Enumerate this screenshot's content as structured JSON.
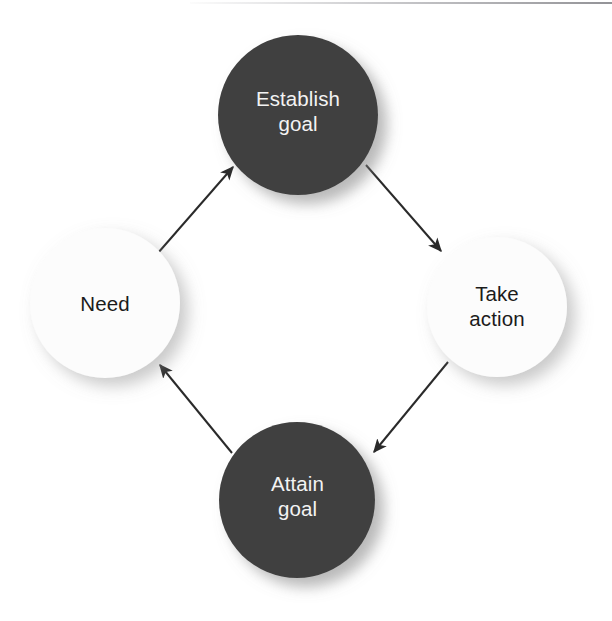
{
  "diagram": {
    "type": "cycle-diagram",
    "background_color": "#ffffff",
    "dark_node_color": "#414141",
    "light_node_color": "#fcfcfc",
    "dark_node_text_color": "#f3f3f3",
    "light_node_text_color": "#1b1b1b",
    "arrow_color": "#2a2a2a",
    "nodes": [
      {
        "id": "establish-goal",
        "label": "Establish\ngoal",
        "style": "dark",
        "position": "top",
        "cx": 298,
        "cy": 115,
        "r": 80
      },
      {
        "id": "take-action",
        "label": "Take\naction",
        "style": "light",
        "position": "right",
        "cx": 497,
        "cy": 307,
        "r": 70
      },
      {
        "id": "attain-goal",
        "label": "Attain\ngoal",
        "style": "dark",
        "position": "bottom",
        "cx": 297,
        "cy": 500,
        "r": 78
      },
      {
        "id": "need",
        "label": "Need",
        "style": "light",
        "position": "left",
        "cx": 105,
        "cy": 303,
        "r": 75
      }
    ],
    "edges": [
      {
        "id": "need-to-establish-goal",
        "from": "need",
        "to": "establish-goal",
        "direction": "up-right"
      },
      {
        "id": "establish-goal-to-take-action",
        "from": "establish-goal",
        "to": "take-action",
        "direction": "down-right"
      },
      {
        "id": "take-action-to-attain-goal",
        "from": "take-action",
        "to": "attain-goal",
        "direction": "down-left"
      },
      {
        "id": "attain-goal-to-need",
        "from": "attain-goal",
        "to": "need",
        "direction": "up-left"
      }
    ]
  }
}
